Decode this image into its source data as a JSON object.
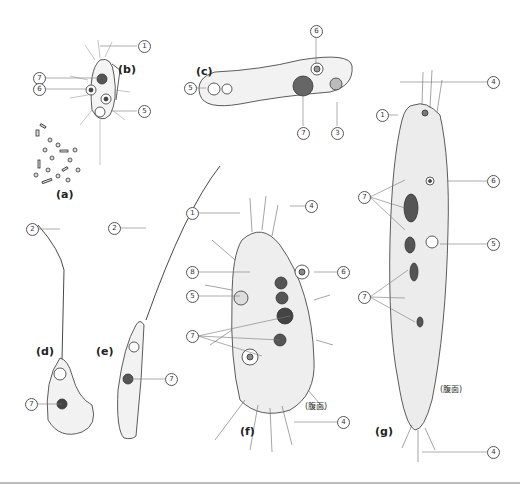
{
  "figure": {
    "panels": [
      {
        "id": "a",
        "label": "(a)"
      },
      {
        "id": "b",
        "label": "(b)"
      },
      {
        "id": "c",
        "label": "(c)"
      },
      {
        "id": "d",
        "label": "(d)"
      },
      {
        "id": "e",
        "label": "(e)"
      },
      {
        "id": "f",
        "label": "(f)"
      },
      {
        "id": "g",
        "label": "(g)"
      }
    ],
    "numbers": {
      "n1": "1",
      "n2": "2",
      "n3": "3",
      "n4": "4",
      "n5": "5",
      "n6": "6",
      "n7": "7",
      "n8": "8"
    },
    "notes": {
      "ventral_f": "(腹面)",
      "ventral_g": "(腹面)"
    }
  }
}
